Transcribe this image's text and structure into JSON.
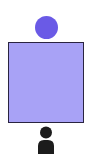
{
  "diagram": {
    "shapes": [
      {
        "type": "circle",
        "name": "top-circle",
        "color": "#6a5ae6"
      },
      {
        "type": "square",
        "name": "main-square",
        "fill": "#a8a2f6",
        "border": "#2a2440"
      },
      {
        "type": "icon",
        "name": "person-icon",
        "color": "#1c1c1c"
      }
    ]
  }
}
